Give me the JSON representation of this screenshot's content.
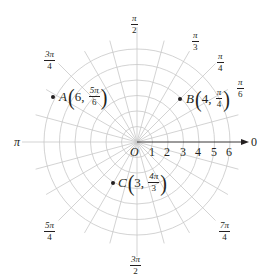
{
  "diagram": {
    "type": "polar-coordinate-grid",
    "origin_label": "O",
    "polar_axis_end_label": "0",
    "radial_ticks": [
      "1",
      "2",
      "3",
      "4",
      "5",
      "6"
    ],
    "circle_radii": [
      1,
      2,
      3,
      4,
      5,
      6
    ],
    "ray_angle_step": "π/12",
    "angle_labels": {
      "pi_over_2": {
        "num": "π",
        "den": "2"
      },
      "pi_over_3": {
        "num": "π",
        "den": "3"
      },
      "pi_over_4": {
        "num": "π",
        "den": "4"
      },
      "pi_over_6": {
        "num": "π",
        "den": "6"
      },
      "three_pi_over_4": {
        "num": "3π",
        "den": "4"
      },
      "pi": "π",
      "five_pi_over_4": {
        "num": "5π",
        "den": "4"
      },
      "three_pi_over_2": {
        "num": "3π",
        "den": "2"
      },
      "seven_pi_over_4": {
        "num": "7π",
        "den": "4"
      }
    },
    "points": [
      {
        "name": "A",
        "r": "6",
        "theta_num": "5π",
        "theta_den": "6"
      },
      {
        "name": "B",
        "r": "4",
        "theta_num": "π",
        "theta_den": "4"
      },
      {
        "name": "C",
        "r": "3",
        "theta_num": "4π",
        "theta_den": "3"
      }
    ],
    "colors": {
      "grid": "#c8c8c8",
      "axis": "#231f20",
      "text": "#231f20",
      "point": "#231f20"
    }
  }
}
